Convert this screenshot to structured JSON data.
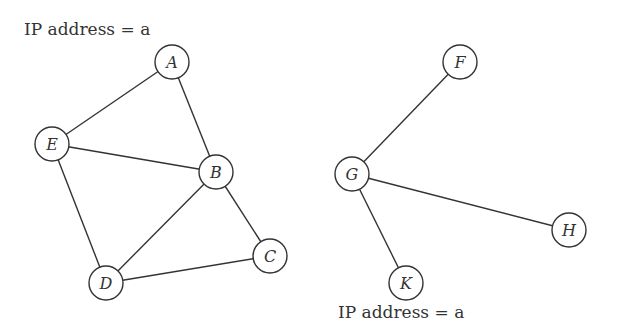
{
  "labels": {
    "top_left": "IP address = a",
    "bottom_right": "IP address = a"
  },
  "nodes": [
    {
      "id": "A",
      "x": 172,
      "y": 62
    },
    {
      "id": "E",
      "x": 52,
      "y": 144
    },
    {
      "id": "B",
      "x": 216,
      "y": 172
    },
    {
      "id": "C",
      "x": 270,
      "y": 256
    },
    {
      "id": "D",
      "x": 106,
      "y": 283
    },
    {
      "id": "F",
      "x": 460,
      "y": 62
    },
    {
      "id": "G",
      "x": 352,
      "y": 174
    },
    {
      "id": "H",
      "x": 569,
      "y": 230
    },
    {
      "id": "K",
      "x": 406,
      "y": 283
    }
  ],
  "edges": [
    [
      "A",
      "E"
    ],
    [
      "A",
      "B"
    ],
    [
      "E",
      "B"
    ],
    [
      "E",
      "D"
    ],
    [
      "B",
      "D"
    ],
    [
      "B",
      "C"
    ],
    [
      "D",
      "C"
    ],
    [
      "F",
      "G"
    ],
    [
      "G",
      "H"
    ],
    [
      "G",
      "K"
    ]
  ],
  "node_radius": 17
}
